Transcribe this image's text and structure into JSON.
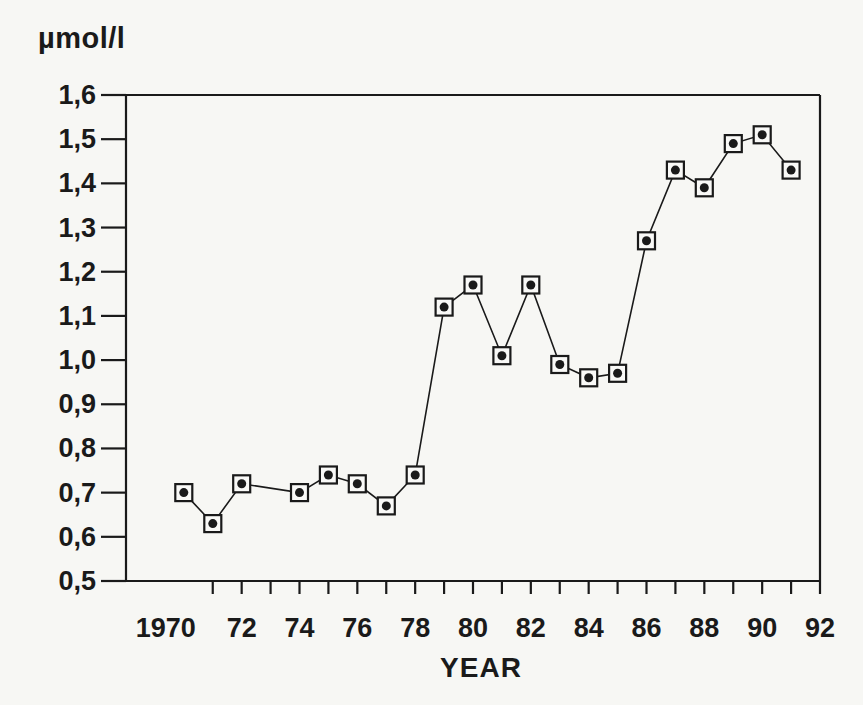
{
  "figure": {
    "background": "#f7f7f4",
    "ink": "#1a1a1a",
    "marker_fill": "#f9f9f7"
  },
  "chart_data": {
    "type": "line",
    "title": "",
    "ylabel": "µmol/l",
    "xlabel": "YEAR",
    "xlim": [
      1968,
      1992
    ],
    "ylim": [
      0.5,
      1.6
    ],
    "grid": false,
    "legend": "none",
    "marker_style": "open-square-with-center-dot",
    "yticks": [
      {
        "value": 1.6,
        "label": "1,6"
      },
      {
        "value": 1.5,
        "label": "1,5"
      },
      {
        "value": 1.4,
        "label": "1,4"
      },
      {
        "value": 1.3,
        "label": "1,3"
      },
      {
        "value": 1.2,
        "label": "1,2"
      },
      {
        "value": 1.1,
        "label": "1,1"
      },
      {
        "value": 1.0,
        "label": "1,0"
      },
      {
        "value": 0.9,
        "label": "0,9"
      },
      {
        "value": 0.8,
        "label": "0,8"
      },
      {
        "value": 0.7,
        "label": "0,7"
      },
      {
        "value": 0.6,
        "label": "0,6"
      },
      {
        "value": 0.5,
        "label": "0,5"
      }
    ],
    "xticks_minor_years": [
      1971,
      1972,
      1973,
      1974,
      1975,
      1976,
      1977,
      1978,
      1979,
      1980,
      1981,
      1982,
      1983,
      1984,
      1985,
      1986,
      1987,
      1988,
      1989,
      1990,
      1991
    ],
    "xtick_labels": [
      {
        "year": 1970,
        "label": "1970"
      },
      {
        "year": 1972,
        "label": "72"
      },
      {
        "year": 1974,
        "label": "74"
      },
      {
        "year": 1976,
        "label": "76"
      },
      {
        "year": 1978,
        "label": "78"
      },
      {
        "year": 1980,
        "label": "80"
      },
      {
        "year": 1982,
        "label": "82"
      },
      {
        "year": 1984,
        "label": "84"
      },
      {
        "year": 1986,
        "label": "86"
      },
      {
        "year": 1988,
        "label": "88"
      },
      {
        "year": 1990,
        "label": "90"
      },
      {
        "year": 1992,
        "label": "92"
      }
    ],
    "points": [
      {
        "year": 1970,
        "value": 0.7
      },
      {
        "year": 1971,
        "value": 0.63
      },
      {
        "year": 1972,
        "value": 0.72
      },
      {
        "year": 1974,
        "value": 0.7
      },
      {
        "year": 1975,
        "value": 0.74
      },
      {
        "year": 1976,
        "value": 0.72
      },
      {
        "year": 1977,
        "value": 0.67
      },
      {
        "year": 1978,
        "value": 0.74
      },
      {
        "year": 1979,
        "value": 1.12
      },
      {
        "year": 1980,
        "value": 1.17
      },
      {
        "year": 1981,
        "value": 1.01
      },
      {
        "year": 1982,
        "value": 1.17
      },
      {
        "year": 1983,
        "value": 0.99
      },
      {
        "year": 1984,
        "value": 0.96
      },
      {
        "year": 1985,
        "value": 0.97
      },
      {
        "year": 1986,
        "value": 1.27
      },
      {
        "year": 1987,
        "value": 1.43
      },
      {
        "year": 1988,
        "value": 1.39
      },
      {
        "year": 1989,
        "value": 1.49
      },
      {
        "year": 1990,
        "value": 1.51
      },
      {
        "year": 1991,
        "value": 1.43
      }
    ]
  }
}
